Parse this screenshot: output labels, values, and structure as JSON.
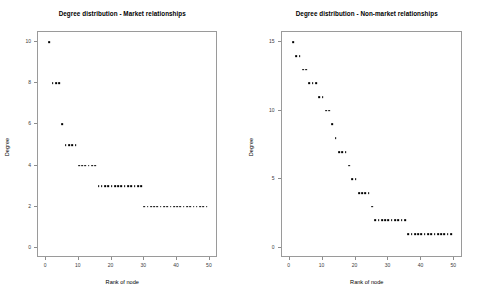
{
  "chart_data": [
    {
      "type": "scatter",
      "title": "Degree distribution - Market relationships",
      "xlabel": "Rank of node",
      "ylabel": "Degree",
      "xlim": [
        0,
        50
      ],
      "ylim": [
        0,
        10
      ],
      "xticks": [
        0,
        10,
        20,
        30,
        40,
        50
      ],
      "yticks": [
        0,
        2,
        4,
        6,
        8,
        10
      ],
      "grid": false,
      "legend": "none",
      "marker": "square",
      "marker_color": "#000000",
      "x": [
        1,
        2,
        3,
        4,
        5,
        6,
        7,
        8,
        9,
        10,
        11,
        12,
        13,
        14,
        15,
        16,
        17,
        18,
        19,
        20,
        21,
        22,
        23,
        24,
        25,
        26,
        27,
        28,
        29,
        30,
        31,
        32,
        33,
        34,
        35,
        36,
        37,
        38,
        39,
        40,
        41,
        42,
        43,
        44,
        45,
        46,
        47,
        48,
        49
      ],
      "y": [
        10,
        8,
        8,
        8,
        6,
        5,
        5,
        5,
        5,
        4,
        4,
        4,
        4,
        4,
        4,
        3,
        3,
        3,
        3,
        3,
        3,
        3,
        3,
        3,
        3,
        3,
        3,
        3,
        3,
        2,
        2,
        2,
        2,
        2,
        2,
        2,
        2,
        2,
        2,
        2,
        2,
        2,
        2,
        2,
        2,
        2,
        2,
        2,
        2
      ]
    },
    {
      "type": "scatter",
      "title": "Degree distribution - Non-market relationships",
      "xlabel": "Rank of node",
      "ylabel": "Degree",
      "xlim": [
        0,
        50
      ],
      "ylim": [
        0,
        15
      ],
      "xticks": [
        0,
        10,
        20,
        30,
        40,
        50
      ],
      "yticks": [
        0,
        5,
        10,
        15
      ],
      "grid": false,
      "legend": "none",
      "marker": "square",
      "marker_color": "#000000",
      "x": [
        1,
        2,
        3,
        4,
        5,
        6,
        7,
        8,
        9,
        10,
        11,
        12,
        13,
        14,
        15,
        16,
        17,
        18,
        19,
        20,
        21,
        22,
        23,
        24,
        25,
        26,
        27,
        28,
        29,
        30,
        31,
        32,
        33,
        34,
        35,
        36,
        37,
        38,
        39,
        40,
        41,
        42,
        43,
        44,
        45,
        46,
        47,
        48,
        49
      ],
      "y": [
        15,
        14,
        14,
        13,
        13,
        12,
        12,
        12,
        11,
        11,
        10,
        10,
        9,
        8,
        7,
        7,
        7,
        6,
        5,
        5,
        4,
        4,
        4,
        4,
        3,
        2,
        2,
        2,
        2,
        2,
        2,
        2,
        2,
        2,
        2,
        1,
        1,
        1,
        1,
        1,
        1,
        1,
        1,
        1,
        1,
        1,
        1,
        1,
        1
      ]
    }
  ]
}
